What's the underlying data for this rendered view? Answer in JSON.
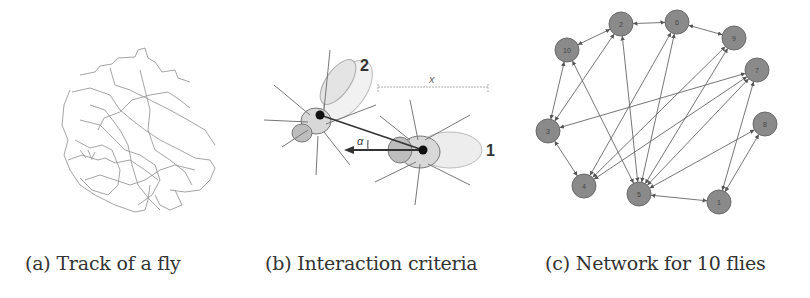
{
  "figure": {
    "panels": [
      {
        "id": "a",
        "caption": "(a) Track of a fly"
      },
      {
        "id": "b",
        "caption": "(b) Interaction criteria",
        "labels": {
          "fly1": "1",
          "fly2": "2",
          "distance": "x",
          "angle": "α"
        }
      },
      {
        "id": "c",
        "caption": "(c) Network for 10 flies"
      }
    ],
    "network": {
      "nodes": [
        {
          "id": "10",
          "x": 47,
          "y": 50
        },
        {
          "id": "2",
          "x": 101,
          "y": 24
        },
        {
          "id": "6",
          "x": 157,
          "y": 22
        },
        {
          "id": "9",
          "x": 214,
          "y": 38
        },
        {
          "id": "7",
          "x": 237,
          "y": 70
        },
        {
          "id": "3",
          "x": 28,
          "y": 131
        },
        {
          "id": "8",
          "x": 245,
          "y": 124
        },
        {
          "id": "4",
          "x": 64,
          "y": 186
        },
        {
          "id": "5",
          "x": 119,
          "y": 194
        },
        {
          "id": "1",
          "x": 199,
          "y": 202
        }
      ],
      "node_color": "#8a8a8a",
      "edge_color": "#666666"
    }
  }
}
